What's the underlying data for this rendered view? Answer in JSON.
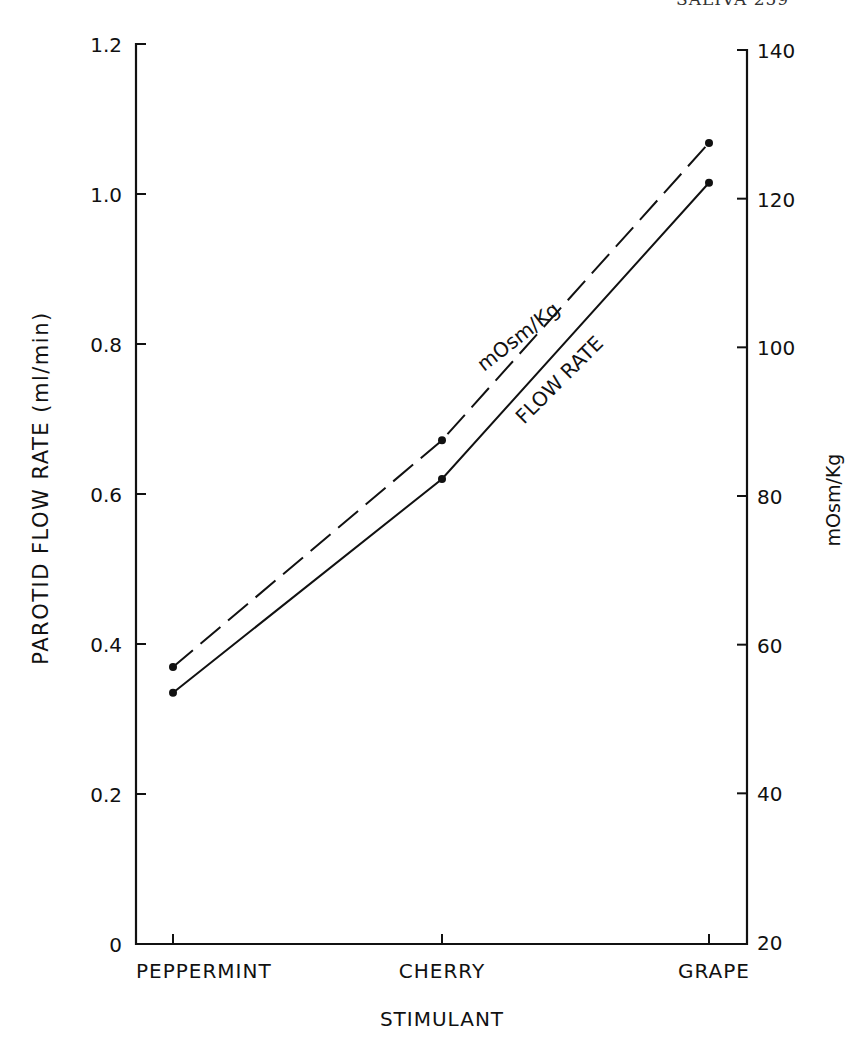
{
  "page": {
    "running_head": "SALIVA     259"
  },
  "chart_data": {
    "type": "line",
    "title": "",
    "xlabel": "STIMULANT",
    "ylabel": "PAROTID FLOW RATE (ml/min)",
    "y2label": "mOsm/Kg",
    "categories": [
      "PEPPERMINT",
      "CHERRY",
      "GRAPE"
    ],
    "ylim": [
      0,
      1.2
    ],
    "y2lim": [
      20,
      140
    ],
    "yticks": [
      "0",
      "0.2",
      "0.4",
      "0.6",
      "0.8",
      "1.0",
      "1.2"
    ],
    "y2ticks": [
      "20",
      "40",
      "60",
      "80",
      "100",
      "120",
      "140"
    ],
    "grid": false,
    "legend": "inline annotations along lines",
    "series": [
      {
        "name": "FLOW RATE",
        "axis": "left",
        "style": "solid",
        "values": [
          0.335,
          0.62,
          1.015
        ]
      },
      {
        "name": "mOsm/Kg",
        "axis": "right",
        "style": "dashed",
        "values": [
          57,
          87.5,
          127.5
        ]
      }
    ],
    "annotations": [
      {
        "text": "mOsm/Kg",
        "series": "mOsm/Kg"
      },
      {
        "text": "FLOW RATE",
        "series": "FLOW RATE"
      }
    ]
  }
}
